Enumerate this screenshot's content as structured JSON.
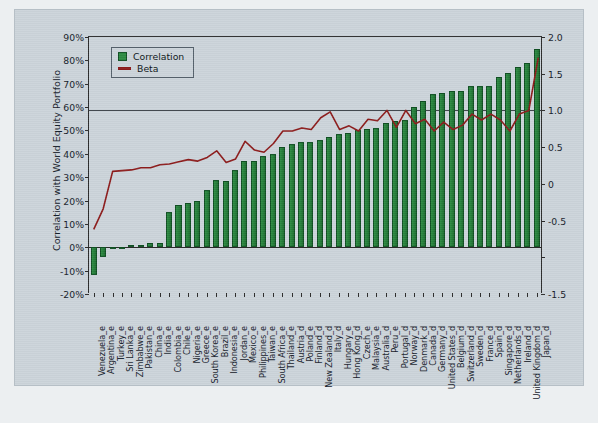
{
  "chart_data": {
    "type": "bar",
    "title": "",
    "xlabel": "",
    "ylabel": "Correlation with World Equity Portfolio",
    "y2label": "",
    "ylim": [
      -0.2,
      0.9
    ],
    "y2lim": [
      -1.5,
      2.0
    ],
    "grid": false,
    "legend_position": "top-left",
    "yticks": [
      "90%",
      "80%",
      "70%",
      "60%",
      "50%",
      "40%",
      "30%",
      "20%",
      "10%",
      "0%",
      "-10%",
      "-20%"
    ],
    "ytick_values": [
      0.9,
      0.8,
      0.7,
      0.6,
      0.5,
      0.4,
      0.3,
      0.2,
      0.1,
      0.0,
      -0.1,
      -0.2
    ],
    "y2ticks": [
      "2.0",
      "1.5",
      "1.0",
      "0.5",
      "0",
      "-0.5",
      "-1.5"
    ],
    "y2tick_values": [
      2.0,
      1.5,
      1.0,
      0.5,
      0.0,
      -0.5,
      -1.5
    ],
    "categories": [
      "Venezuela_e",
      "Argentina_e",
      "Turkey_e",
      "Sri Lanka_e",
      "Zimbabwe_e",
      "Pakistan_e",
      "China_e",
      "India_e",
      "Colombia_e",
      "Chile_e",
      "Nigeria_e",
      "Greece_e",
      "South Korea_e",
      "Brazil_e",
      "Indonesia_e",
      "Jordan_e",
      "Mexico_e",
      "Philippines_e",
      "Taiwan_e",
      "South Africa_e",
      "Thailand_e",
      "Austria_d",
      "Poland_e",
      "Finland_d",
      "New Zealand_d",
      "Italy_d",
      "Hungary_e",
      "Hong Kong_d",
      "Czech_e",
      "Malaysia_e",
      "Australia_d",
      "Peru_e",
      "Portugal_d",
      "Norway_d",
      "Denmark_d",
      "Canada_d",
      "Germany_d",
      "United States_d",
      "Belgium_d",
      "Switzerland_d",
      "Sweden_d",
      "France_d",
      "Spain_d",
      "Singapore_d",
      "Netherlands_d",
      "Ireland_d",
      "United Kingdom_d",
      "Japan_d"
    ],
    "series": [
      {
        "name": "Correlation",
        "axis": "left",
        "unit": "percent",
        "color": "#2e8b43",
        "values": [
          -0.12,
          -0.04,
          0.0,
          0.0,
          0.01,
          0.01,
          0.02,
          0.02,
          0.15,
          0.18,
          0.19,
          0.2,
          0.245,
          0.29,
          0.285,
          0.33,
          0.37,
          0.37,
          0.39,
          0.4,
          0.43,
          0.44,
          0.45,
          0.45,
          0.46,
          0.47,
          0.485,
          0.49,
          0.5,
          0.505,
          0.51,
          0.53,
          0.54,
          0.545,
          0.6,
          0.625,
          0.655,
          0.66,
          0.67,
          0.67,
          0.69,
          0.69,
          0.69,
          0.73,
          0.745,
          0.77,
          0.79,
          0.85
        ]
      },
      {
        "name": "Beta",
        "axis": "right",
        "unit": "ratio",
        "color": "#8c1b1b",
        "values": [
          -0.62,
          -0.34,
          0.17,
          0.18,
          0.19,
          0.22,
          0.22,
          0.26,
          0.27,
          0.3,
          0.33,
          0.31,
          0.36,
          0.45,
          0.29,
          0.34,
          0.58,
          0.46,
          0.43,
          0.55,
          0.72,
          0.72,
          0.76,
          0.74,
          0.9,
          0.98,
          0.74,
          0.79,
          0.72,
          0.88,
          0.86,
          1.0,
          0.77,
          1.0,
          0.82,
          0.88,
          0.72,
          0.84,
          0.74,
          0.8,
          0.95,
          0.87,
          0.95,
          0.87,
          0.72,
          0.95,
          1.0,
          1.72
        ]
      }
    ],
    "beta_spikes_note": "",
    "beta_values_detailed": [
      -0.62,
      -0.34,
      0.17,
      0.18,
      0.19,
      0.22,
      0.22,
      0.26,
      0.27,
      0.3,
      0.33,
      0.31,
      0.36,
      0.45,
      0.29,
      0.34,
      0.58,
      0.46,
      0.43,
      0.55,
      0.72,
      0.72,
      0.76,
      0.74,
      0.9,
      0.98,
      0.74,
      0.79,
      0.72,
      0.88,
      0.86,
      1.0,
      0.77,
      1.0,
      0.82,
      0.88,
      0.72,
      0.84,
      0.74,
      0.8,
      0.95,
      0.87,
      0.95,
      0.87,
      0.72,
      0.95,
      1.0,
      1.72
    ]
  },
  "legend": {
    "items": [
      {
        "label": "Correlation",
        "type": "bar",
        "color": "#2e8b43"
      },
      {
        "label": "Beta",
        "type": "line",
        "color": "#8c1b1b"
      }
    ]
  },
  "axes": {
    "left_title": "Correlation with World Equity Portfolio"
  },
  "colors": {
    "bar_green": "#2e8b43",
    "bar_green_dark": "#0f4f22",
    "beta_red": "#8c1b1b",
    "panel_bg": "#ccd4da",
    "page_bg": "#eceff1",
    "axis": "#2b2b2b"
  }
}
